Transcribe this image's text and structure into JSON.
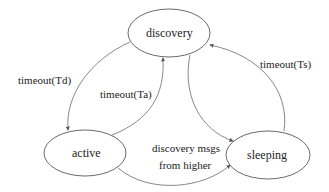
{
  "diagram": {
    "type": "state-machine",
    "nodes": [
      {
        "id": "discovery",
        "label": "discovery"
      },
      {
        "id": "active",
        "label": "active"
      },
      {
        "id": "sleeping",
        "label": "sleeping"
      }
    ],
    "edges": [
      {
        "from": "discovery",
        "to": "active",
        "label": "timeout(Td)"
      },
      {
        "from": "active",
        "to": "discovery",
        "label": "timeout(Ta)"
      },
      {
        "from": "sleeping",
        "to": "discovery",
        "label": "timeout(Ts)"
      },
      {
        "from": "discovery",
        "to": "sleeping",
        "label": ""
      },
      {
        "from": "active",
        "to": "sleeping",
        "label_line1": "discovery msgs",
        "label_line2": "from higher"
      }
    ]
  }
}
